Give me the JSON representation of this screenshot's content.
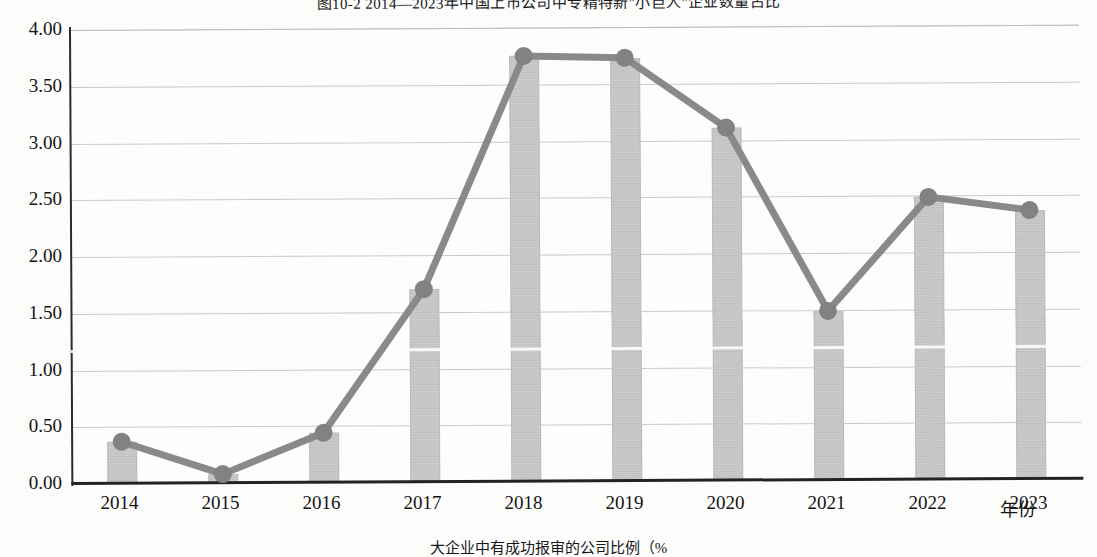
{
  "figure": {
    "title": "图10-2 2014—2023年中国上市公司中专精特新\"小巨人\"企业数量占比",
    "caption": "大企业中有成功报审的公司比例（%"
  },
  "chart_data": {
    "type": "bar",
    "title": "图10-2 2014—2023年中国上市公司中专精特新\"小巨人\"企业数量占比",
    "xlabel": "年份",
    "ylabel": "",
    "categories": [
      "2014",
      "2015",
      "2016",
      "2017",
      "2018",
      "2019",
      "2020",
      "2021",
      "2022",
      "2023"
    ],
    "values": [
      0.37,
      0.08,
      0.44,
      1.7,
      3.75,
      3.73,
      3.11,
      1.49,
      2.49,
      2.37
    ],
    "series": [
      {
        "name": "占比",
        "type": "bar",
        "values": [
          0.37,
          0.08,
          0.44,
          1.7,
          3.75,
          3.73,
          3.11,
          1.49,
          2.49,
          2.37
        ]
      },
      {
        "name": "占比趋势线",
        "type": "line",
        "values": [
          0.37,
          0.08,
          0.44,
          1.7,
          3.75,
          3.73,
          3.11,
          1.49,
          2.49,
          2.37
        ]
      }
    ],
    "ylim": [
      0.0,
      4.0
    ],
    "yticks": [
      "0.00",
      "0.50",
      "1.00",
      "1.50",
      "2.00",
      "2.50",
      "3.00",
      "3.50",
      "4.00"
    ],
    "ytick_values": [
      0.0,
      0.5,
      1.0,
      1.5,
      2.0,
      2.5,
      3.0,
      3.5,
      4.0
    ],
    "grid": true,
    "legend": false,
    "colors": {
      "bar": "#c6c6c6",
      "line": "#8a8a8a",
      "marker": "#828282",
      "axis": "#232323",
      "gridline": "#b9b9b9"
    }
  }
}
